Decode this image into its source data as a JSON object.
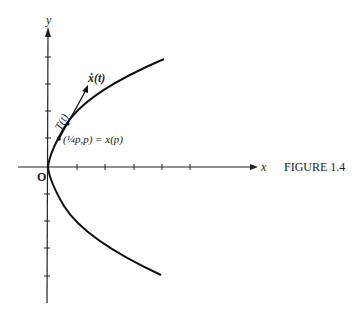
{
  "figure": {
    "caption": "FIGURE 1.4",
    "axes": {
      "x_label": "x",
      "y_label": "y",
      "origin_label": "O"
    },
    "annotations": {
      "velocity_label": "ẋ(t)",
      "tangent_label": "T(t)",
      "point_label": "(¼p,p) = x(p)"
    },
    "curve": "parabola x = y²/4 opening right",
    "colors": {
      "ink": "#222222",
      "background": "#ffffff"
    }
  }
}
